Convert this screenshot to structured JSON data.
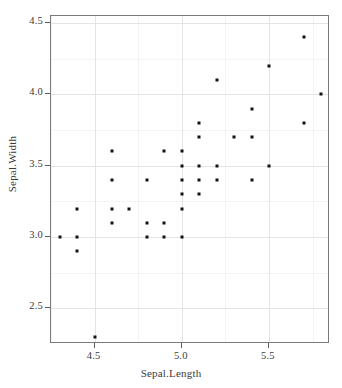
{
  "chart_data": {
    "type": "scatter",
    "title": "",
    "xlabel": "Sepal.Length",
    "ylabel": "Sepal.Width",
    "xlim": [
      4.25,
      5.85
    ],
    "ylim": [
      2.25,
      4.55
    ],
    "xticks": [
      4.5,
      5.0,
      5.5
    ],
    "xtick_labels": [
      "4.5",
      "5.0",
      "5.5"
    ],
    "yticks": [
      2.5,
      3.0,
      3.5,
      4.0,
      4.5
    ],
    "ytick_labels": [
      "2.5",
      "3.0",
      "3.5",
      "4.0",
      "4.5"
    ],
    "grid": true,
    "grid_minor": true,
    "legend": "none",
    "marker": "filled-square",
    "marker_color": "#121212",
    "marker_size": 3,
    "panel_border_color": "#7a7a7a",
    "grid_color": "#e9e9e9",
    "points": [
      {
        "x": 4.3,
        "y": 3.0
      },
      {
        "x": 4.4,
        "y": 3.2
      },
      {
        "x": 4.4,
        "y": 3.0
      },
      {
        "x": 4.4,
        "y": 2.9
      },
      {
        "x": 4.5,
        "y": 2.3
      },
      {
        "x": 4.6,
        "y": 3.6
      },
      {
        "x": 4.6,
        "y": 3.4
      },
      {
        "x": 4.6,
        "y": 3.2
      },
      {
        "x": 4.6,
        "y": 3.1
      },
      {
        "x": 4.7,
        "y": 3.2
      },
      {
        "x": 4.8,
        "y": 3.4
      },
      {
        "x": 4.8,
        "y": 3.1
      },
      {
        "x": 4.8,
        "y": 3.0
      },
      {
        "x": 4.9,
        "y": 3.6
      },
      {
        "x": 4.9,
        "y": 3.1
      },
      {
        "x": 4.9,
        "y": 3.0
      },
      {
        "x": 5.0,
        "y": 3.6
      },
      {
        "x": 5.0,
        "y": 3.5
      },
      {
        "x": 5.0,
        "y": 3.4
      },
      {
        "x": 5.0,
        "y": 3.3
      },
      {
        "x": 5.0,
        "y": 3.2
      },
      {
        "x": 5.0,
        "y": 3.0
      },
      {
        "x": 5.1,
        "y": 3.8
      },
      {
        "x": 5.1,
        "y": 3.7
      },
      {
        "x": 5.1,
        "y": 3.5
      },
      {
        "x": 5.1,
        "y": 3.4
      },
      {
        "x": 5.1,
        "y": 3.3
      },
      {
        "x": 5.2,
        "y": 4.1
      },
      {
        "x": 5.2,
        "y": 3.5
      },
      {
        "x": 5.2,
        "y": 3.4
      },
      {
        "x": 5.3,
        "y": 3.7
      },
      {
        "x": 5.4,
        "y": 3.9
      },
      {
        "x": 5.4,
        "y": 3.7
      },
      {
        "x": 5.4,
        "y": 3.4
      },
      {
        "x": 5.5,
        "y": 4.2
      },
      {
        "x": 5.5,
        "y": 3.5
      },
      {
        "x": 5.7,
        "y": 4.4
      },
      {
        "x": 5.7,
        "y": 3.8
      },
      {
        "x": 5.8,
        "y": 4.0
      }
    ],
    "xgrid_minor": [
      4.25,
      4.75,
      5.25,
      5.75
    ],
    "ygrid_minor": [
      2.25,
      2.75,
      3.25,
      3.75,
      4.25
    ]
  }
}
